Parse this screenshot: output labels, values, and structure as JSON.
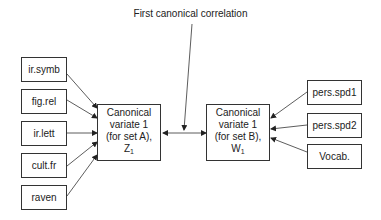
{
  "diagram": {
    "title": "First canonical correlation",
    "set_a": {
      "variables": [
        "ir.symb",
        "fig.rel",
        "ir.lett",
        "cult.fr",
        "raven"
      ],
      "variate": {
        "line1": "Canonical",
        "line2": "variate 1",
        "line3": "(for set A),",
        "symbol": "Z",
        "subscript": "1"
      }
    },
    "set_b": {
      "variables": [
        "pers.spd1",
        "pers.spd2",
        "Vocab."
      ],
      "variate": {
        "line1": "Canonical",
        "line2": "variate 1",
        "line3": "(for set B),",
        "symbol": "W",
        "subscript": "1"
      }
    },
    "colors": {
      "line": "#333333",
      "text": "#222222",
      "background": "#ffffff"
    }
  }
}
